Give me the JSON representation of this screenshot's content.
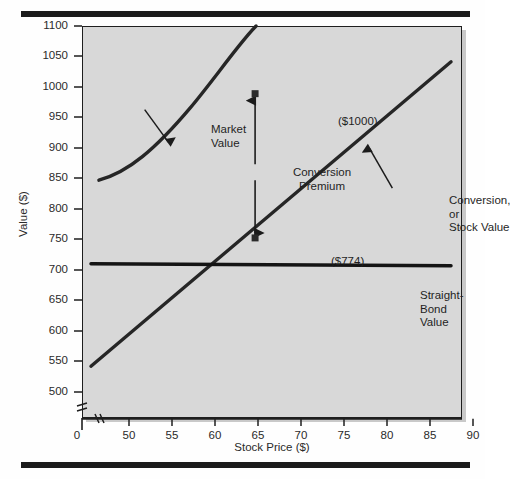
{
  "figure": {
    "background_color": "#fefefe",
    "plot_background_color": "#d8d8d8",
    "line_color": "#262626",
    "rule_color": "#1b1b1b"
  },
  "chart_data": {
    "type": "line",
    "title": "",
    "xlabel": "Stock Price ($)",
    "ylabel": "Value ($)",
    "xlim": [
      45,
      90
    ],
    "ylim": [
      475,
      1100
    ],
    "x_axis_origin_label": "0",
    "x_axis_break": true,
    "y_axis_break": true,
    "grid": false,
    "legend": "annotations",
    "xticks": [
      50,
      55,
      60,
      65,
      70,
      75,
      80,
      85,
      90
    ],
    "yticks": [
      500,
      550,
      600,
      650,
      700,
      750,
      800,
      850,
      900,
      950,
      1000,
      1050,
      1100
    ],
    "series": [
      {
        "name": "Market Value",
        "style": "curve",
        "points": [
          {
            "x": 48.0,
            "y": 850
          },
          {
            "x": 50.0,
            "y": 855
          },
          {
            "x": 52.0,
            "y": 864
          },
          {
            "x": 54.0,
            "y": 876
          },
          {
            "x": 56.0,
            "y": 891
          },
          {
            "x": 58.0,
            "y": 909
          },
          {
            "x": 60.0,
            "y": 930
          },
          {
            "x": 62.0,
            "y": 952
          },
          {
            "x": 65.0,
            "y": 1000
          },
          {
            "x": 68.0,
            "y": 1033
          },
          {
            "x": 70.0,
            "y": 1053
          },
          {
            "x": 72.0,
            "y": 1074
          },
          {
            "x": 74.3,
            "y": 1098
          }
        ]
      },
      {
        "name": "Conversion, or Stock Value",
        "style": "straight",
        "points": [
          {
            "x": 46.8,
            "y": 552
          },
          {
            "x": 65.0,
            "y": 774
          },
          {
            "x": 88.8,
            "y": 1043
          }
        ]
      },
      {
        "name": "Straight-Bond Value",
        "style": "flat",
        "points": [
          {
            "x": 46.8,
            "y": 716
          },
          {
            "x": 88.8,
            "y": 713
          }
        ]
      }
    ],
    "annotations": [
      {
        "name": "market-value",
        "text": "Market\nValue",
        "points_to": {
          "x": 60.5,
          "y": 932
        }
      },
      {
        "name": "conversion-premium",
        "text": "Conversion\nPremium",
        "from": {
          "x": 65,
          "y": 774
        },
        "to": {
          "x": 65,
          "y": 1000
        }
      },
      {
        "name": "conversion-stock-value",
        "text": "Conversion, or\nStock Value",
        "points_to": {
          "x": 77.5,
          "y": 905
        }
      },
      {
        "name": "straight-bond-value",
        "text": "Straight-Bond Value"
      },
      {
        "name": "market-value-point",
        "text": "($1000)",
        "at": {
          "x": 65,
          "y": 1000
        }
      },
      {
        "name": "conversion-value-point",
        "text": "($774)",
        "at": {
          "x": 65,
          "y": 774
        }
      }
    ]
  },
  "ticks": {
    "y": [
      {
        "label": "1100",
        "top": 26
      },
      {
        "label": "1050",
        "top": 56
      },
      {
        "label": "1000",
        "top": 87
      },
      {
        "label": "950",
        "top": 117
      },
      {
        "label": "900",
        "top": 148
      },
      {
        "label": "850",
        "top": 178
      },
      {
        "label": "800",
        "top": 209
      },
      {
        "label": "750",
        "top": 239
      },
      {
        "label": "700",
        "top": 270
      },
      {
        "label": "650",
        "top": 300
      },
      {
        "label": "600",
        "top": 331
      },
      {
        "label": "550",
        "top": 361
      },
      {
        "label": "500",
        "top": 392
      }
    ],
    "x": [
      {
        "label": "0",
        "left": 57
      },
      {
        "label": "50",
        "left": 109
      },
      {
        "label": "55",
        "left": 152
      },
      {
        "label": "60",
        "left": 195
      },
      {
        "label": "65",
        "left": 238
      },
      {
        "label": "70",
        "left": 281
      },
      {
        "label": "75",
        "left": 324
      },
      {
        "label": "80",
        "left": 367
      },
      {
        "label": "85",
        "left": 410
      },
      {
        "label": "90",
        "left": 453
      }
    ]
  },
  "labels": {
    "market_value": "Market\nValue",
    "conversion_premium": "Conversion\nPremium",
    "conversion_stock_value": "Conversion, or\nStock Value",
    "straight_bond_value": "Straight-Bond Value",
    "value_1000": "($1000)",
    "value_774": "($774)",
    "y_axis": "Value ($)",
    "x_axis": "Stock Price ($)"
  }
}
